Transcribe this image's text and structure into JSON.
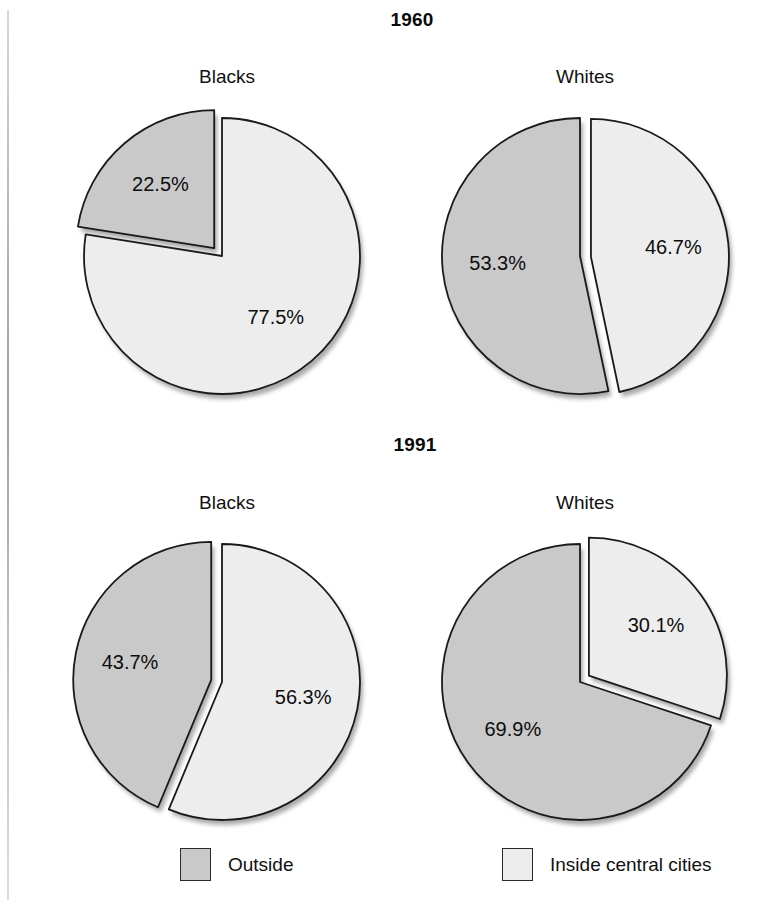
{
  "figure": {
    "background": "#ffffff",
    "sections": [
      {
        "year_label": "1960"
      },
      {
        "year_label": "1991"
      }
    ],
    "group_labels": {
      "blacks": "Blacks",
      "whites": "Whites"
    }
  },
  "legend": {
    "position": "bottom",
    "items": [
      {
        "label": "Outside",
        "color": "#c9c9c9",
        "swatch_name": "legend-swatch-outside"
      },
      {
        "label": "Inside central cities",
        "color": "#ededed",
        "swatch_name": "legend-swatch-inside"
      }
    ]
  },
  "colors": {
    "outside": "#c9c9c9",
    "inside": "#ededed",
    "outline": "#1a1a1a",
    "shadow": "#9a9a9a"
  },
  "chart_data": {
    "type": "pie",
    "legend_entries": [
      "Outside",
      "Inside central cities"
    ],
    "legend_position": "bottom",
    "value_unit": "percent",
    "charts": [
      {
        "id": "pie-1960-blacks",
        "year": "1960",
        "group": "Blacks",
        "labels": [
          "Outside",
          "Inside central cities"
        ],
        "values": [
          22.5,
          77.5
        ],
        "value_labels": [
          "22.5%",
          "77.5%"
        ],
        "exploded_slice": "Outside",
        "explode_direction_deg": 315
      },
      {
        "id": "pie-1960-whites",
        "year": "1960",
        "group": "Whites",
        "labels": [
          "Outside",
          "Inside central cities"
        ],
        "values": [
          53.3,
          46.7
        ],
        "value_labels": [
          "53.3%",
          "46.7%"
        ],
        "exploded_slice": "Inside central cities",
        "explode_direction_deg": 95
      },
      {
        "id": "pie-1991-blacks",
        "year": "1991",
        "group": "Blacks",
        "labels": [
          "Outside",
          "Inside central cities"
        ],
        "values": [
          43.7,
          56.3
        ],
        "value_labels": [
          "43.7%",
          "56.3%"
        ],
        "exploded_slice": "Outside",
        "explode_direction_deg": 281
      },
      {
        "id": "pie-1991-whites",
        "year": "1991",
        "group": "Whites",
        "labels": [
          "Outside",
          "Inside central cities"
        ],
        "values": [
          69.9,
          30.1
        ],
        "value_labels": [
          "69.9%",
          "30.1%"
        ],
        "exploded_slice": "Inside central cities",
        "explode_direction_deg": 54
      }
    ]
  }
}
